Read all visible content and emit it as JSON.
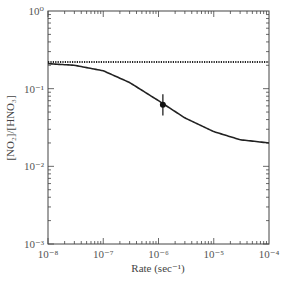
{
  "chart_data": {
    "type": "line",
    "title": "",
    "xlabel": "Rate (sec⁻¹)",
    "ylabel": "[NO₂]/[HNO₃]",
    "xscale": "log",
    "yscale": "log",
    "xlim": [
      1e-08,
      0.0001
    ],
    "ylim": [
      0.001,
      1
    ],
    "x_ticks": [
      "10⁻⁸",
      "10⁻⁷",
      "10⁻⁶",
      "10⁻⁵",
      "10⁻⁴"
    ],
    "y_ticks": [
      "10⁰",
      "10⁻¹",
      "10⁻²",
      "10⁻³"
    ],
    "grid": false,
    "legend": null,
    "series": [
      {
        "name": "constant reference (dotted)",
        "style": "dotted",
        "x": [
          1e-08,
          0.0001
        ],
        "y": [
          0.22,
          0.22
        ]
      },
      {
        "name": "model curve (solid)",
        "style": "solid",
        "x": [
          1e-08,
          3e-08,
          1e-07,
          3e-07,
          1e-06,
          3e-06,
          1e-05,
          3e-05,
          0.0001
        ],
        "y": [
          0.21,
          0.2,
          0.17,
          0.12,
          0.07,
          0.042,
          0.028,
          0.022,
          0.02
        ]
      },
      {
        "name": "measurement",
        "style": "point-with-errorbar",
        "x": [
          1.2e-06
        ],
        "y": [
          0.062
        ],
        "y_err_low": [
          0.045
        ],
        "y_err_high": [
          0.085
        ]
      }
    ]
  }
}
